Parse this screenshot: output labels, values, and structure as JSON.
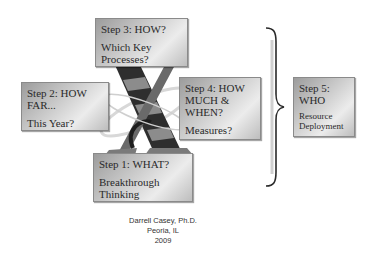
{
  "steps": [
    {
      "id": "step3",
      "title": "Step 3:  HOW?",
      "subtitle": "Which Key Processes?"
    },
    {
      "id": "step2",
      "title": "Step 2:  HOW FAR...",
      "subtitle": "This Year?"
    },
    {
      "id": "step4",
      "title": "Step 4:  HOW MUCH & WHEN?",
      "subtitle": "Measures?"
    },
    {
      "id": "step1",
      "title": "Step 1: WHAT?",
      "subtitle": "Breakthrough Thinking"
    },
    {
      "id": "step5",
      "title": "Step 5: WHO",
      "subtitle": "Resource Deployment"
    }
  ],
  "center_graphic": {
    "icon": "x-letter-graphic",
    "colors": [
      "#2b2b2b",
      "#888888",
      "#bdbdbd"
    ]
  },
  "connector": {
    "icon": "right-curly-brace"
  },
  "credits": {
    "author": "Darrell Casey, Ph.D.",
    "location": "Peoria, IL",
    "year": "2009"
  }
}
